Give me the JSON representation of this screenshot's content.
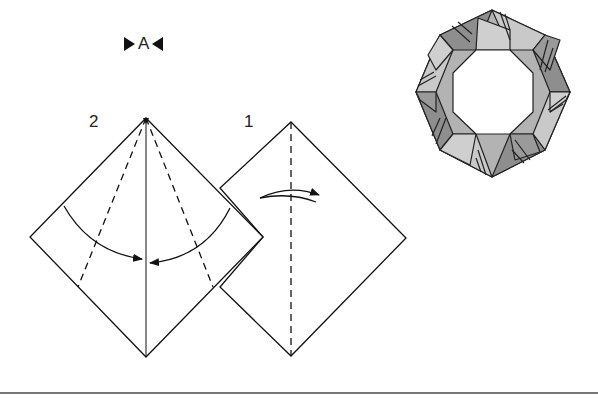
{
  "reference": {
    "label": "A"
  },
  "steps": [
    {
      "number": "2",
      "description": "Fold both sides to the center crease along dashed valley lines"
    },
    {
      "number": "1",
      "description": "Fold in half along vertical dashed line and unfold"
    }
  ],
  "finished_model": {
    "name": "Octagonal ring",
    "segments": 8
  },
  "colors": {
    "line": "#111111",
    "dark_fill": "#8e8e8e",
    "light_fill": "#c9c9c9",
    "rule": "#777777"
  }
}
